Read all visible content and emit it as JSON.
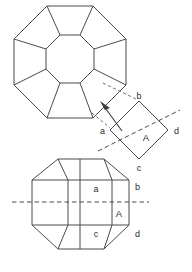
{
  "diagram": {
    "line_color": "#4a4a4a",
    "dash_color": "#6e6e6e",
    "background": "#ffffff",
    "label_color": "#2e2e2e"
  },
  "top_view": {
    "name": "crown top view",
    "outer_shape": "octagon",
    "inner_shape": "octagon",
    "facet_count": 8,
    "outer_polygon": "47,6 93,6 126,39 126,85 93,118 47,118 14,85 14,39",
    "inner_polygon": "60,35 80,35 94,49 94,69 80,83 60,83 46,69 46,49",
    "spokes": [
      [
        "47,6",
        "60,35"
      ],
      [
        "93,6",
        "80,35"
      ],
      [
        "126,39",
        "94,49"
      ],
      [
        "126,85",
        "94,69"
      ],
      [
        "93,118",
        "80,83"
      ],
      [
        "47,118",
        "60,83"
      ],
      [
        "14,85",
        "46,69"
      ],
      [
        "14,39",
        "46,49"
      ]
    ]
  },
  "detail_view": {
    "name": "magnified facet A",
    "shape": "rotated square",
    "square_points": "110,130 139,101 168,130 139,159",
    "girdle_line": [
      "97,152",
      "181,110"
    ],
    "labels": {
      "a": "a",
      "b": "b",
      "c": "c",
      "d": "d",
      "facet": "A"
    },
    "leader_lines": [
      [
        "101,84",
        "135,100"
      ],
      [
        "93,114",
        "112,128"
      ]
    ],
    "arrow": {
      "from": "123,131",
      "to": "103,105"
    }
  },
  "side_view": {
    "name": "profile side view",
    "outline": "58,159 104,159 129,180 129,225 104,249 58,249 32,225 32,180",
    "girdle_dashed": [
      "12,202",
      "148,202"
    ],
    "crown_lines": [
      [
        "58,159",
        "68,180"
      ],
      [
        "104,159",
        "112,180"
      ],
      [
        "80,159",
        "80,180"
      ]
    ],
    "pavilion_lines": [
      [
        "58,249",
        "68,225"
      ],
      [
        "104,249",
        "112,225"
      ],
      [
        "80,249",
        "80,225"
      ]
    ],
    "girdle_band": [
      [
        "32,180",
        "129,180"
      ],
      [
        "32,225",
        "129,225"
      ],
      [
        "68,180",
        "68,225"
      ],
      [
        "112,180",
        "112,225"
      ],
      [
        "80,180",
        "80,225"
      ]
    ],
    "labels": {
      "a": "a",
      "b": "b",
      "c": "c",
      "d": "d",
      "facet": "A"
    }
  }
}
